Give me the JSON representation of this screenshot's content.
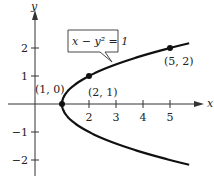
{
  "chart_data": {
    "type": "line",
    "title": "",
    "equation_label": "x − y² = 1",
    "xlabel": "x",
    "ylabel": "y",
    "xlim": [
      -1.2,
      5.8
    ],
    "ylim": [
      -2.6,
      2.6
    ],
    "x_ticks": [
      1,
      2,
      3,
      4,
      5
    ],
    "x_tick_labels": [
      "2",
      "3",
      "4",
      "5"
    ],
    "y_ticks": [
      -2,
      -1,
      1,
      2
    ],
    "y_tick_labels": [
      "−2",
      "−1",
      "1",
      "2"
    ],
    "grid": false,
    "curve": {
      "equation": "x = y^2 + 1",
      "y_range": [
        -2.17,
        2.17
      ]
    },
    "points": [
      {
        "x": 1,
        "y": 0,
        "label": "(1, 0)"
      },
      {
        "x": 2,
        "y": 1,
        "label": "(2, 1)"
      },
      {
        "x": 5,
        "y": 2,
        "label": "(5, 2)"
      }
    ],
    "colors": {
      "curve": "#111111",
      "axis": "#333333",
      "background": "#ffffff"
    }
  }
}
